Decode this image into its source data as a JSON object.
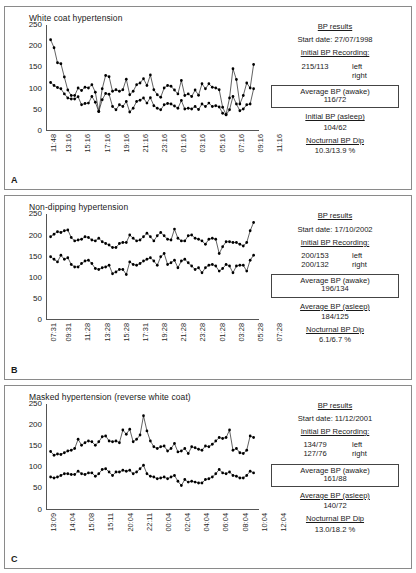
{
  "figure": {
    "panels": [
      {
        "letter": "A",
        "title": "White coat hypertension",
        "results": {
          "heading": "BP results",
          "start_date_label": "Start date: 27/07/1998",
          "initial_recording_label": "Initial BP Recording:",
          "initial_left_value": "215/113",
          "initial_left_side": "left",
          "initial_right_value": "",
          "initial_right_side": "right",
          "awake_label": "Average BP (awake)",
          "awake_value": "116/72",
          "asleep_label": "Initial BP (asleep)",
          "asleep_value": "104/62",
          "dip_label": "Nocturnal BP Dip",
          "dip_value": "10.3/13.9 %"
        },
        "chart_data": {
          "type": "line",
          "title": "White coat hypertension",
          "xlabel": "",
          "ylabel": "",
          "ylim": [
            0,
            250
          ],
          "yticks": [
            0,
            50,
            100,
            150,
            200,
            250
          ],
          "grid": false,
          "legend": "none",
          "tick_labels": [
            "11:48",
            "13:16",
            "15:16",
            "17:16",
            "19:16",
            "21:16",
            "23:16",
            "01:16",
            "03:16",
            "05:16",
            "07:16",
            "09:16",
            "11:16"
          ],
          "tick_indices": [
            0,
            4,
            9,
            14,
            19,
            24,
            29,
            34,
            39,
            44,
            49,
            54,
            59
          ],
          "series": [
            {
              "name": "systolic",
              "values": [
                215,
                196,
                160,
                158,
                126,
                95,
                82,
                82,
                100,
                94,
                102,
                100,
                108,
                90,
                44,
                98,
                130,
                127,
                92,
                96,
                92,
                96,
                121,
                84,
                92,
                108,
                112,
                122,
                106,
                131,
                96,
                84,
                78,
                100,
                106,
                104,
                95,
                86,
                118,
                82,
                86,
                80,
                95,
                83,
                110,
                98,
                110,
                102,
                100,
                96,
                54,
                37,
                76,
                146,
                120,
                62,
                82,
                112,
                100,
                156
              ]
            },
            {
              "name": "diastolic",
              "values": [
                113,
                106,
                101,
                98,
                86,
                76,
                74,
                74,
                79,
                60,
                63,
                64,
                80,
                66,
                44,
                72,
                87,
                85,
                56,
                48,
                60,
                56,
                68,
                43,
                52,
                68,
                71,
                76,
                64,
                77,
                58,
                52,
                48,
                60,
                63,
                62,
                57,
                52,
                70,
                50,
                52,
                50,
                56,
                49,
                62,
                56,
                64,
                56,
                58,
                55,
                40,
                36,
                48,
                80,
                62,
                46,
                50,
                60,
                62,
                98
              ]
            }
          ]
        }
      },
      {
        "letter": "B",
        "title": "Non-dipping hypertension",
        "results": {
          "heading": "BP results",
          "start_date_label": "Start date: 17/10/2002",
          "initial_recording_label": "Initial BP Recording:",
          "initial_left_value": "200/153",
          "initial_left_side": "left",
          "initial_right_value": "200/132",
          "initial_right_side": "right",
          "awake_label": "Average BP (awake)",
          "awake_value": "196/134",
          "asleep_label": "Average BP (asleep)",
          "asleep_value": "184/125",
          "dip_label": "Nocturnal BP Dip",
          "dip_value": "6.1/6.7 %"
        },
        "chart_data": {
          "type": "line",
          "title": "Non-dipping hypertension",
          "xlabel": "",
          "ylabel": "",
          "ylim": [
            0,
            250
          ],
          "yticks": [
            0,
            50,
            100,
            150,
            200,
            250
          ],
          "grid": false,
          "legend": "none",
          "tick_labels": [
            "07:31",
            "09:31",
            "11:28",
            "13:28",
            "15:28",
            "17:31",
            "19:28",
            "21:28",
            "23:28",
            "01:28",
            "03:28",
            "05:28",
            "07:28"
          ],
          "tick_indices": [
            0,
            4,
            9,
            14,
            19,
            24,
            29,
            34,
            39,
            44,
            49,
            54,
            59
          ],
          "series": [
            {
              "name": "systolic",
              "values": [
                196,
                202,
                208,
                206,
                210,
                212,
                194,
                186,
                188,
                190,
                196,
                194,
                188,
                186,
                192,
                184,
                180,
                176,
                170,
                170,
                180,
                182,
                182,
                200,
                192,
                186,
                188,
                196,
                204,
                196,
                186,
                198,
                206,
                198,
                190,
                188,
                214,
                192,
                186,
                186,
                198,
                200,
                192,
                190,
                186,
                178,
                190,
                192,
                190,
                156,
                172,
                184,
                184,
                182,
                182,
                178,
                174,
                182,
                210,
                230
              ]
            },
            {
              "name": "diastolic",
              "values": [
                148,
                142,
                136,
                152,
                142,
                146,
                130,
                124,
                124,
                132,
                138,
                140,
                132,
                120,
                118,
                122,
                124,
                128,
                108,
                112,
                118,
                118,
                106,
                136,
                130,
                128,
                132,
                138,
                142,
                146,
                138,
                128,
                148,
                156,
                130,
                134,
                140,
                122,
                138,
                142,
                134,
                126,
                118,
                122,
                110,
                122,
                128,
                130,
                126,
                114,
                120,
                130,
                126,
                110,
                126,
                128,
                128,
                114,
                140,
                152
              ]
            }
          ]
        }
      },
      {
        "letter": "C",
        "title": "Masked hypertension (reverse white coat)",
        "results": {
          "heading": "BP results",
          "start_date_label": "Start date: 11/12/2001",
          "initial_recording_label": "Initial BP Recording:",
          "initial_left_value": "134/79",
          "initial_left_side": "left",
          "initial_right_value": "127/76",
          "initial_right_side": "right",
          "awake_label": "Average BP (awake)",
          "awake_value": "161/88",
          "asleep_label": "Average BP (asleep)",
          "asleep_value": "140/72",
          "dip_label": "Nocturnal BP Dip",
          "dip_value": "13.0/18.2 %"
        },
        "chart_data": {
          "type": "line",
          "title": "Masked hypertension (reverse white coat)",
          "xlabel": "",
          "ylabel": "",
          "ylim": [
            0,
            250
          ],
          "yticks": [
            0,
            50,
            100,
            150,
            200,
            250
          ],
          "grid": false,
          "legend": "none",
          "tick_labels": [
            "13:09",
            "14:04",
            "15:08",
            "15:11",
            "20:04",
            "22:11",
            "00:04",
            "02:04",
            "04:04",
            "06:04",
            "08:04",
            "10:04",
            "12:04"
          ],
          "tick_indices": [
            0,
            5,
            10,
            15,
            20,
            25,
            30,
            35,
            40,
            45,
            50,
            55,
            60
          ],
          "series": [
            {
              "name": "systolic",
              "values": [
                137,
                128,
                131,
                130,
                134,
                138,
                140,
                144,
                166,
                152,
                158,
                162,
                160,
                152,
                160,
                172,
                174,
                162,
                160,
                162,
                158,
                188,
                178,
                190,
                160,
                166,
                176,
                222,
                186,
                162,
                148,
                144,
                148,
                150,
                138,
                144,
                156,
                136,
                138,
                144,
                132,
                148,
                146,
                142,
                140,
                150,
                148,
                154,
                162,
                170,
                168,
                170,
                188,
                140,
                144,
                134,
                132,
                140,
                174,
                170
              ]
            },
            {
              "name": "diastolic",
              "values": [
                76,
                74,
                76,
                80,
                84,
                84,
                82,
                82,
                90,
                84,
                82,
                86,
                86,
                78,
                84,
                94,
                96,
                88,
                80,
                88,
                88,
                92,
                90,
                92,
                84,
                88,
                96,
                104,
                84,
                78,
                76,
                72,
                74,
                76,
                72,
                76,
                80,
                66,
                56,
                70,
                64,
                66,
                64,
                62,
                62,
                70,
                72,
                76,
                84,
                94,
                86,
                84,
                88,
                80,
                78,
                74,
                74,
                80,
                90,
                86
              ]
            }
          ]
        }
      }
    ]
  }
}
